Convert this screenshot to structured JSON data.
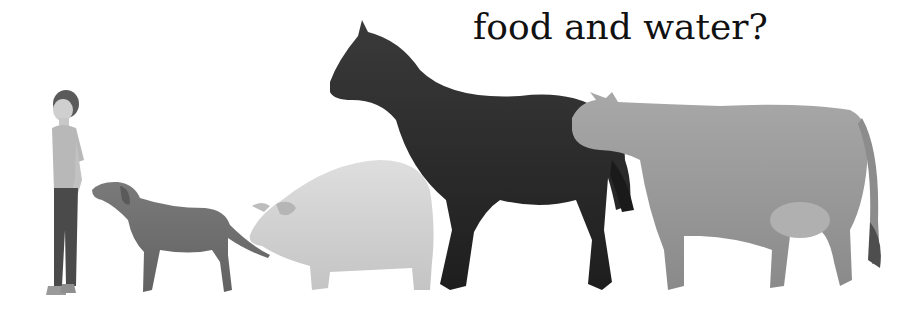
{
  "caption": "food and water?",
  "figures": [
    {
      "name": "boy",
      "shade": "#8a8a8a"
    },
    {
      "name": "dog",
      "shade": "#6e6e6e"
    },
    {
      "name": "pig",
      "shade": "#d2d2d2"
    },
    {
      "name": "horse",
      "shade": "#2e2e2e"
    },
    {
      "name": "cow",
      "shade": "#9a9a9a"
    }
  ]
}
